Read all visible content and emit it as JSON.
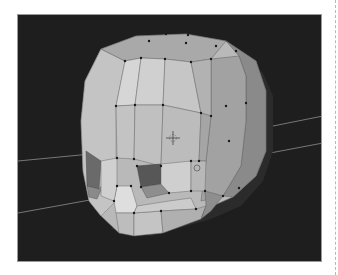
{
  "figure": {
    "viewport": {
      "background": "#1e1e1e",
      "border": "#9a9a9a",
      "mesh_light": "#c9c9c9",
      "mesh_mid": "#a8a8a8",
      "mesh_dark": "#7a7a7a",
      "socket_dark": "#555555",
      "edge": "#5a5a5a",
      "vertex": "#1a1a1a",
      "grid_line": "#9c9c9c"
    },
    "icons": {
      "cursor": "3d-cursor-icon",
      "pivot": "pivot-point-icon"
    }
  }
}
